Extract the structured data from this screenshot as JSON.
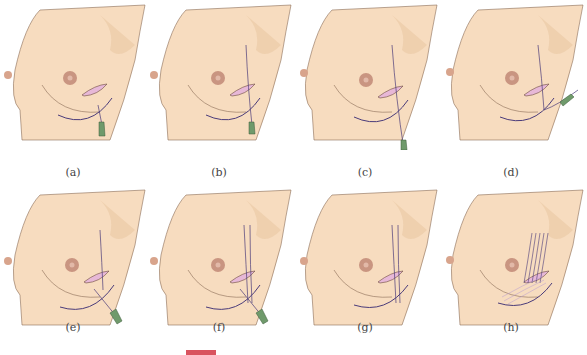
{
  "figure": {
    "panels": [
      {
        "id": "a",
        "caption": "(a)",
        "variant": "needle-down"
      },
      {
        "id": "b",
        "caption": "(b)",
        "variant": "needle-up-line"
      },
      {
        "id": "c",
        "caption": "(c)",
        "variant": "needle-long-down"
      },
      {
        "id": "d",
        "caption": "(d)",
        "variant": "needle-side"
      },
      {
        "id": "e",
        "caption": "(e)",
        "variant": "needle-diagonal"
      },
      {
        "id": "f",
        "caption": "(f)",
        "variant": "double-line-needle"
      },
      {
        "id": "g",
        "caption": "(g)",
        "variant": "double-line"
      },
      {
        "id": "h",
        "caption": "(h)",
        "variant": "multiple-lines"
      }
    ],
    "colors": {
      "skin": "#f7dcbf",
      "skin_shadow": "#eac8a3",
      "outline": "#8a6b55",
      "areola": "#c99581",
      "incision": "#e7b8d7",
      "thread": "#4a3b7a",
      "needle": "#6f9a6b",
      "caption": "#444444",
      "footer_bar": "#d9535f"
    }
  }
}
